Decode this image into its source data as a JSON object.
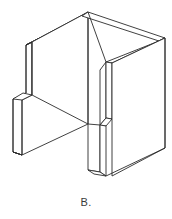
{
  "figure": {
    "caption": "B.",
    "label_letter": "B",
    "view": "isometric",
    "background_color": "#ffffff",
    "line_color": "#2b2b2b",
    "face_color": "#ffffff",
    "parts": [
      {
        "name": "left-wing-panel",
        "role": "thin vertical slab on the left with stepped notch"
      },
      {
        "name": "back-panel",
        "role": "large rear face rising to apex"
      },
      {
        "name": "right-panel",
        "role": "large right face"
      },
      {
        "name": "inner-rib",
        "role": "narrow vertical rib forming the slot"
      },
      {
        "name": "center-leg",
        "role": "narrow vertical leg below the slot"
      },
      {
        "name": "top-rim",
        "role": "thin folded top band"
      }
    ]
  }
}
